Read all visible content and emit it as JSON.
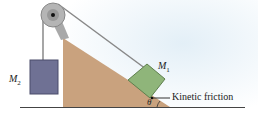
{
  "figure": {
    "mass_hanging": {
      "symbol": "M",
      "subscript": "2"
    },
    "mass_incline": {
      "symbol": "M",
      "subscript": "1"
    },
    "friction_label": "Kinetic friction",
    "angle_label": "θ"
  },
  "colors": {
    "incline": "#c9a27e",
    "block_m1": "#8fb57a",
    "block_m2": "#6f7194",
    "rope": "#777777",
    "pulley": "#9a9a9a",
    "ground": "#444444",
    "background_tint": "#e6f1f8"
  }
}
